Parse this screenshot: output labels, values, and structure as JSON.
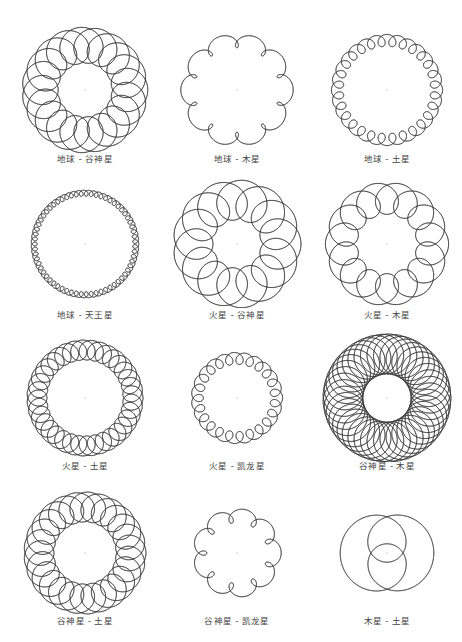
{
  "figure": {
    "background": "#ffffff",
    "stroke_color": "#333333",
    "caption_color": "#444444",
    "panels": [
      {
        "caption": "地球 - 谷神星",
        "cx": 85,
        "cy": 90,
        "R": 52,
        "loops": 20,
        "r": 18,
        "center_dot": true
      },
      {
        "caption": "地球 - 木星",
        "cx": 237,
        "cy": 90,
        "R": 52,
        "loops": 11,
        "r": 7,
        "center_dot": true
      },
      {
        "caption": "地球 - 土星",
        "cx": 387,
        "cy": 90,
        "R": 52,
        "loops": 29,
        "r": 6,
        "center_dot": true
      },
      {
        "caption": "地球 - 天王星",
        "cx": 85,
        "cy": 244,
        "R": 52,
        "loops": 64,
        "r": 3,
        "center_dot": true
      },
      {
        "caption": "火星 - 谷神星",
        "cx": 237,
        "cy": 244,
        "R": 52,
        "loops": 14,
        "r": 20,
        "center_dot": true
      },
      {
        "caption": "火星 - 木星",
        "cx": 387,
        "cy": 244,
        "R": 52,
        "loops": 15,
        "r": 16,
        "center_dot": true
      },
      {
        "caption": "火星 - 土星",
        "cx": 85,
        "cy": 398,
        "R": 52,
        "loops": 36,
        "r": 10,
        "center_dot": true
      },
      {
        "caption": "火星 - 凯龙星",
        "cx": 237,
        "cy": 398,
        "R": 42,
        "loops": 24,
        "r": 6,
        "center_dot": true
      },
      {
        "caption": "谷神星 - 木星",
        "cx": 387,
        "cy": 398,
        "R": 52,
        "loops": 42,
        "r": 20,
        "center_dot": true
      },
      {
        "caption": "谷神星 - 土星",
        "cx": 85,
        "cy": 553,
        "R": 52,
        "loops": 26,
        "r": 15,
        "center_dot": true
      },
      {
        "caption": "谷神星 - 凯龙星",
        "cx": 237,
        "cy": 553,
        "R": 40,
        "loops": 10,
        "r": 7,
        "center_dot": true
      },
      {
        "caption": "木星 - 土星",
        "cx": 387,
        "cy": 553,
        "R": 30,
        "loops": 3,
        "r": 28,
        "center_dot": true
      }
    ]
  }
}
